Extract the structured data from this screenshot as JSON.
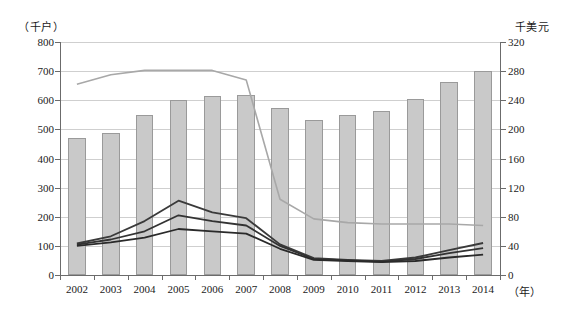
{
  "chart_data": {
    "type": "bar",
    "title": "",
    "subtitle": "",
    "xlabel": "（年）",
    "ylabel_left": "（千户）",
    "ylabel_right": "千美元",
    "grid": true,
    "legend_position": "none",
    "categories": [
      "2002",
      "2003",
      "2004",
      "2005",
      "2006",
      "2007",
      "2008",
      "2009",
      "2010",
      "2011",
      "2012",
      "2013",
      "2014"
    ],
    "ylim_left": [
      0,
      800
    ],
    "ylim_right": [
      0,
      320
    ],
    "yticks_left": [
      "0",
      "100",
      "200",
      "300",
      "400",
      "500",
      "600",
      "700",
      "800"
    ],
    "yticks_right": [
      "0",
      "40",
      "80",
      "120",
      "160",
      "200",
      "240",
      "280",
      "320"
    ],
    "ytick_values_left": [
      0,
      100,
      200,
      300,
      400,
      500,
      600,
      700,
      800
    ],
    "ytick_values_right": [
      0,
      40,
      80,
      120,
      160,
      200,
      240,
      280,
      320
    ],
    "series": [
      {
        "name": "bars",
        "kind": "bar",
        "axis": "left",
        "color": "#c9c9c9",
        "edge_color": "#9a9a9a",
        "values": [
          472,
          488,
          548,
          600,
          616,
          618,
          575,
          533,
          551,
          562,
          606,
          664,
          702
        ]
      },
      {
        "name": "gray-line",
        "kind": "line",
        "axis": "right",
        "color": "#a8a8a8",
        "width": 1.6,
        "values": [
          262,
          275,
          281,
          281,
          281,
          268,
          104,
          77,
          72,
          70,
          70,
          70,
          68
        ]
      },
      {
        "name": "dark-line-1",
        "kind": "line",
        "axis": "left",
        "color": "#3a3a3a",
        "width": 1.8,
        "values": [
          108,
          133,
          185,
          255,
          215,
          195,
          105,
          58,
          52,
          48,
          60,
          85,
          110
        ]
      },
      {
        "name": "dark-line-2",
        "kind": "line",
        "axis": "left",
        "color": "#333333",
        "width": 1.8,
        "values": [
          104,
          122,
          150,
          205,
          185,
          170,
          100,
          55,
          50,
          46,
          55,
          75,
          92
        ]
      },
      {
        "name": "dark-line-3",
        "kind": "line",
        "axis": "left",
        "color": "#2a2a2a",
        "width": 1.8,
        "values": [
          100,
          112,
          128,
          158,
          150,
          142,
          90,
          52,
          48,
          44,
          48,
          60,
          70
        ]
      }
    ]
  },
  "axes": {
    "left_unit": "（千户）",
    "right_unit": "千美元",
    "x_unit": "（年）"
  },
  "colors": {
    "bar_fill": "#c9c9c9",
    "bar_edge": "#9a9a9a",
    "grid": "#cfcfcf",
    "axis": "#6b6b6b",
    "gray_line": "#a8a8a8",
    "dark_line": "#303030",
    "background": "#ffffff"
  }
}
